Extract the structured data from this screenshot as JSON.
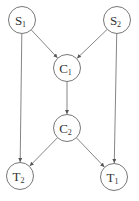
{
  "diagram": {
    "type": "directed-graph",
    "nodes": [
      {
        "id": "S1",
        "label": "S",
        "sub": "1",
        "cx": 22,
        "cy": 20
      },
      {
        "id": "S2",
        "label": "S",
        "sub": "2",
        "cx": 117,
        "cy": 20
      },
      {
        "id": "C1",
        "label": "C",
        "sub": "1",
        "cx": 67,
        "cy": 68
      },
      {
        "id": "C2",
        "label": "C",
        "sub": "2",
        "cx": 67,
        "cy": 128
      },
      {
        "id": "T2",
        "label": "T",
        "sub": "2",
        "cx": 20,
        "cy": 176
      },
      {
        "id": "T1",
        "label": "T",
        "sub": "1",
        "cx": 114,
        "cy": 177
      }
    ],
    "edges": [
      {
        "from": "S1",
        "to": "C1"
      },
      {
        "from": "S2",
        "to": "C1"
      },
      {
        "from": "C1",
        "to": "C2"
      },
      {
        "from": "S1",
        "to": "T2"
      },
      {
        "from": "S2",
        "to": "T1"
      },
      {
        "from": "C2",
        "to": "T2"
      },
      {
        "from": "C2",
        "to": "T1"
      }
    ],
    "colors": {
      "stroke": "#777777",
      "text": "#333333"
    }
  }
}
